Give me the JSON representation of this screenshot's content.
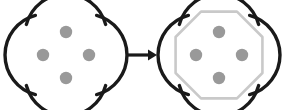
{
  "figure": {
    "kind": "knot-transformation-diagram",
    "background_color": "#ffffff",
    "width": 286,
    "height": 110,
    "description": "Two symmetric four-arc knot diagrams joined by a rightward arrow; the right diagram adds a light gray octagonal frame.",
    "stroke_color": "#1a1a1a",
    "stroke_width": 3.4,
    "crossing_dot_color": "#999999",
    "crossing_dot_radius": 6.2,
    "octagon_color": "#c9c9c9",
    "octagon_stroke_width": 2.6,
    "arrow_color": "#1a1a1a"
  },
  "left_diagram": {
    "label": "source-knot-diagram",
    "center_x": 66,
    "center_y": 55,
    "arc_count": 4,
    "arc_radius": 41,
    "arc_offset": 20,
    "arc_sweep_degrees": 150,
    "rotation_offsets": [
      0,
      90,
      180,
      270
    ],
    "has_octagon": false,
    "crossing_dots": [
      {
        "name": "crossing-top",
        "x": 66,
        "y": 32
      },
      {
        "name": "crossing-left",
        "x": 43,
        "y": 55
      },
      {
        "name": "crossing-right",
        "x": 89,
        "y": 55
      },
      {
        "name": "crossing-bottom",
        "x": 66,
        "y": 78
      }
    ]
  },
  "right_diagram": {
    "label": "result-knot-diagram",
    "center_x": 219,
    "center_y": 55,
    "arc_count": 4,
    "arc_radius": 41,
    "arc_offset": 20,
    "arc_sweep_degrees": 150,
    "rotation_offsets": [
      0,
      90,
      180,
      270
    ],
    "has_octagon": true,
    "octagon_radius": 47,
    "octagon_vertex_count": 8,
    "crossing_dots": [
      {
        "name": "crossing-top",
        "x": 219,
        "y": 32
      },
      {
        "name": "crossing-left",
        "x": 196,
        "y": 55
      },
      {
        "name": "crossing-right",
        "x": 242,
        "y": 55
      },
      {
        "name": "crossing-bottom",
        "x": 219,
        "y": 78
      }
    ]
  },
  "arrow": {
    "label": "transformation-arrow",
    "glyph": "→",
    "x_start": 127,
    "x_end": 157,
    "y": 55,
    "shaft_width": 3.2,
    "head_length": 9,
    "head_half_height": 5.5
  }
}
